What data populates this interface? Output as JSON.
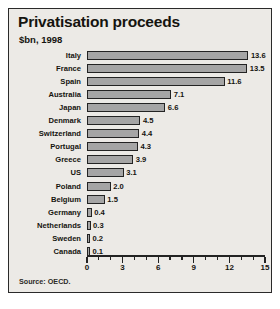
{
  "figure": {
    "title": "Privatisation proceeds",
    "subtitle": "$bn, 1998",
    "source": "Source: OECD.",
    "background_color": "#eceae6",
    "border_color": "#2a2a2a",
    "bar_fill_color": "#a5a5a5",
    "bar_border_color": "#232323"
  },
  "chart_data": {
    "type": "bar",
    "orientation": "horizontal",
    "title": "Privatisation proceeds",
    "subtitle": "$bn, 1998",
    "xlabel": "",
    "ylabel": "",
    "xlim": [
      0,
      15
    ],
    "xticks": [
      0,
      3,
      6,
      9,
      12,
      15
    ],
    "xtick_labels": [
      "0",
      "3",
      "6",
      "9",
      "12",
      "15"
    ],
    "minor_tick_step": 1,
    "grid": false,
    "legend": false,
    "value_labels": true,
    "categories": [
      "Italy",
      "France",
      "Spain",
      "Australia",
      "Japan",
      "Denmark",
      "Switzerland",
      "Portugal",
      "Greece",
      "US",
      "Poland",
      "Belgium",
      "Germany",
      "Netherlands",
      "Sweden",
      "Canada"
    ],
    "values": [
      13.6,
      13.5,
      11.6,
      7.1,
      6.6,
      4.5,
      4.4,
      4.3,
      3.9,
      3.1,
      2.0,
      1.5,
      0.4,
      0.3,
      0.2,
      0.1
    ],
    "value_label_texts": [
      "13.6",
      "13.5",
      "11.6",
      "7.1",
      "6.6",
      "4.5",
      "4.4",
      "4.3",
      "3.9",
      "3.1",
      "2.0",
      "1.5",
      "0.4",
      "0.3",
      "0.2",
      "0.1"
    ]
  }
}
